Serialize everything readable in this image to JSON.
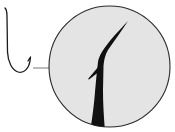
{
  "figure": {
    "colors": {
      "background": "#ffffff",
      "line": "#1a1a1a",
      "magnifier_fill": "#e4e4e4",
      "magnifier_stroke": "#2a2a2a",
      "connector": "#555555",
      "hook_fill": "#111111"
    },
    "parts": {
      "small_hook": "whole-hook-outline",
      "connector": "leader-line",
      "magnifier": "magnified-detail-circle",
      "point": "hook-point",
      "barb": "hook-barb",
      "shank": "hook-shank"
    }
  }
}
